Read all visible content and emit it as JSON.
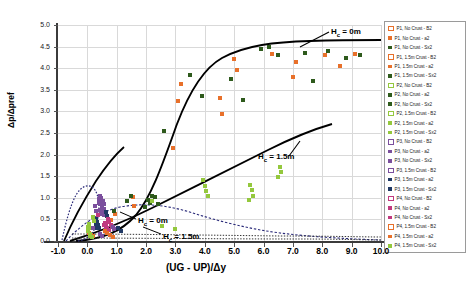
{
  "chart_data": {
    "type": "scatter",
    "title": "",
    "xlabel": "(UG - UP)/Δy",
    "ylabel": "Δp/Δpref",
    "xlim": [
      -1.0,
      10.0
    ],
    "ylim": [
      0.0,
      5.0
    ],
    "xticks": [
      "-1.0",
      "0.0",
      "1.0",
      "2.0",
      "3.0",
      "4.0",
      "5.0",
      "6.0",
      "7.0",
      "8.0",
      "9.0",
      "10.0"
    ],
    "yticks": [
      "0.0",
      "0.5",
      "1.0",
      "1.5",
      "2.0",
      "2.5",
      "3.0",
      "3.5",
      "4.0",
      "4.5",
      "5.0"
    ],
    "grid": true,
    "legend_position": "right",
    "colors": {
      "orange": "#E8702A",
      "dark_green": "#2E5A1C",
      "light_green": "#94C83D",
      "purple": "#7B4F9D",
      "dark_blue": "#1F3864",
      "magenta": "#C0397F",
      "curve": "#000000"
    },
    "annotations": [
      {
        "text": "H",
        "sub": "c",
        "rest": " = 0m",
        "x": 331,
        "y": 27,
        "name": "annotation-hc-0m-upper"
      },
      {
        "text": "H",
        "sub": "c",
        "rest": " = 1.5m",
        "x": 258,
        "y": 152,
        "name": "annotation-hc-15m-upper"
      },
      {
        "text": "H",
        "sub": "c",
        "rest": " = 0m",
        "x": 138,
        "y": 216,
        "name": "annotation-hc-0m-lower"
      },
      {
        "text": "H",
        "sub": "c",
        "rest": " = 1.5m",
        "x": 163,
        "y": 232,
        "name": "annotation-hc-15m-lower"
      }
    ],
    "series": [
      {
        "name": "P1, No Crust - B2",
        "marker": "hollow-square",
        "color": "#E8702A",
        "points": []
      },
      {
        "name": "P1, No Crust - a2",
        "marker": "square",
        "color": "#E8702A",
        "points": [
          [
            3.1,
            3.25
          ],
          [
            3.2,
            3.64
          ],
          [
            4.5,
            3.3
          ],
          [
            4.6,
            2.94
          ],
          [
            5.0,
            4.22
          ],
          [
            5.1,
            3.95
          ],
          [
            6.3,
            4.33
          ],
          [
            7.0,
            3.8
          ],
          [
            7.1,
            4.14
          ],
          [
            8.1,
            4.3
          ],
          [
            8.6,
            4.05
          ],
          [
            9.1,
            4.33
          ],
          [
            2.9,
            2.15
          ]
        ]
      },
      {
        "name": "P1, No Crust - Sx2",
        "marker": "square",
        "color": "#2E5A1C",
        "points": [
          [
            3.5,
            3.85
          ],
          [
            3.9,
            3.35
          ],
          [
            4.9,
            3.75
          ],
          [
            5.3,
            3.26
          ],
          [
            5.9,
            4.45
          ],
          [
            6.2,
            4.5
          ],
          [
            6.5,
            4.3
          ],
          [
            7.4,
            4.36
          ],
          [
            7.7,
            3.71
          ],
          [
            8.2,
            4.4
          ],
          [
            8.8,
            4.23
          ],
          [
            9.3,
            4.3
          ],
          [
            2.6,
            2.55
          ]
        ]
      },
      {
        "name": "P1, 1.5m Crust - B2",
        "marker": "hollow-square",
        "color": "#E8702A",
        "points": []
      },
      {
        "name": "P1, 1.5m Crust - a2",
        "marker": "square",
        "color": "#E8702A",
        "points": [
          [
            1.55,
            1.02
          ],
          [
            1.6,
            0.8
          ],
          [
            0.95,
            0.62
          ],
          [
            0.8,
            0.48
          ]
        ]
      },
      {
        "name": "P1, 1.5m Crust - Sx2",
        "marker": "square",
        "color": "#2E5A1C",
        "points": [
          [
            1.5,
            1.05
          ],
          [
            1.35,
            0.92
          ],
          [
            0.9,
            0.7
          ]
        ]
      },
      {
        "name": "P2, No Crust - B2",
        "marker": "hollow-square",
        "color": "#94C83D",
        "points": []
      },
      {
        "name": "P2, No Crust - a2",
        "marker": "square",
        "color": "#2E5A1C",
        "points": [
          [
            2.05,
            0.95
          ],
          [
            2.15,
            0.88
          ],
          [
            2.2,
            1.05
          ],
          [
            1.95,
            0.78
          ]
        ]
      },
      {
        "name": "P2, No Crust - Sx2",
        "marker": "square",
        "color": "#2E5A1C",
        "points": [
          [
            2.3,
            1.02
          ],
          [
            2.4,
            0.85
          ]
        ]
      },
      {
        "name": "P2, 1.5m Crust - B2",
        "marker": "hollow-square",
        "color": "#94C83D",
        "points": []
      },
      {
        "name": "P2, 1.5m Crust - a2",
        "marker": "square",
        "color": "#94C83D",
        "points": [
          [
            3.95,
            1.42
          ],
          [
            4.0,
            1.28
          ],
          [
            4.05,
            1.15
          ],
          [
            5.55,
            1.3
          ],
          [
            5.6,
            1.18
          ],
          [
            5.65,
            1.05
          ],
          [
            6.55,
            1.72
          ],
          [
            6.6,
            1.6
          ],
          [
            2.2,
            0.92
          ]
        ]
      },
      {
        "name": "P2, 1.5m Crust - Sx2",
        "marker": "square",
        "color": "#94C83D",
        "points": [
          [
            4.1,
            1.05
          ],
          [
            5.5,
            0.95
          ],
          [
            6.5,
            1.48
          ]
        ]
      },
      {
        "name": "P3, No Crust - B2",
        "marker": "hollow-square",
        "color": "#7B4F9D",
        "points": []
      },
      {
        "name": "P3, No Crust - a2",
        "marker": "square",
        "color": "#7B4F9D",
        "points": [
          [
            0.42,
            1.05
          ],
          [
            0.45,
            0.95
          ],
          [
            0.48,
            0.85
          ],
          [
            0.5,
            0.76
          ],
          [
            0.52,
            0.68
          ],
          [
            0.55,
            0.6
          ]
        ]
      },
      {
        "name": "P3, No Crust - Sx2",
        "marker": "square",
        "color": "#7B4F9D",
        "points": [
          [
            0.38,
            0.98
          ],
          [
            0.4,
            0.88
          ],
          [
            0.44,
            0.72
          ],
          [
            0.46,
            0.62
          ]
        ]
      },
      {
        "name": "P3, 1.5m Crust - B2",
        "marker": "hollow-square",
        "color": "#7B4F9D",
        "points": []
      },
      {
        "name": "P3, 1.5m Crust - a2",
        "marker": "square",
        "color": "#1F3864",
        "points": [
          [
            0.3,
            0.52
          ],
          [
            0.33,
            0.44
          ],
          [
            0.36,
            0.36
          ],
          [
            0.39,
            0.3
          ]
        ]
      },
      {
        "name": "P3, 1.5m Crust - Sx2",
        "marker": "square",
        "color": "#1F3864",
        "points": [
          [
            0.28,
            0.46
          ],
          [
            0.31,
            0.38
          ],
          [
            0.34,
            0.31
          ]
        ]
      },
      {
        "name": "P4, No Crust - B2",
        "marker": "hollow-square",
        "color": "#C0397F",
        "points": []
      },
      {
        "name": "P4, No Crust - a2",
        "marker": "square",
        "color": "#C0397F",
        "points": [
          [
            0.6,
            0.42
          ],
          [
            0.64,
            0.36
          ],
          [
            0.68,
            0.3
          ],
          [
            0.72,
            0.25
          ]
        ]
      },
      {
        "name": "P4, No Crust - Sx2",
        "marker": "square",
        "color": "#C0397F",
        "points": [
          [
            0.56,
            0.38
          ],
          [
            0.62,
            0.31
          ],
          [
            0.66,
            0.26
          ]
        ]
      },
      {
        "name": "P4, 1.5m Crust - B2",
        "marker": "hollow-square",
        "color": "#E8702A",
        "points": []
      },
      {
        "name": "P4, 1.5m Crust - a2",
        "marker": "square",
        "color": "#E8702A",
        "points": [
          [
            0.05,
            0.18
          ],
          [
            0.12,
            0.14
          ],
          [
            0.2,
            0.11
          ]
        ]
      },
      {
        "name": "P4, 1.5m Crust - Sx2",
        "marker": "square",
        "color": "#94C83D",
        "points": [
          [
            0.02,
            0.32
          ],
          [
            0.03,
            0.22
          ],
          [
            0.08,
            0.16
          ],
          [
            0.15,
            0.1
          ]
        ]
      }
    ],
    "extra_points": [
      {
        "x": 0.1,
        "y": 0.3,
        "color": "#94C83D"
      },
      {
        "x": 0.1,
        "y": 0.12,
        "color": "#94C83D"
      },
      {
        "x": 0.05,
        "y": 0.4,
        "color": "#94C83D"
      },
      {
        "x": 0.2,
        "y": 0.3,
        "color": "#7B4F9D"
      },
      {
        "x": 0.55,
        "y": 0.85,
        "color": "#7B4F9D"
      },
      {
        "x": 0.58,
        "y": 0.75,
        "color": "#7B4F9D"
      },
      {
        "x": 0.62,
        "y": 0.66,
        "color": "#1F3864"
      },
      {
        "x": 0.66,
        "y": 0.58,
        "color": "#1F3864"
      },
      {
        "x": 0.7,
        "y": 0.5,
        "color": "#C0397F"
      },
      {
        "x": 0.74,
        "y": 0.44,
        "color": "#C0397F"
      },
      {
        "x": 0.8,
        "y": 0.38,
        "color": "#C0397F"
      },
      {
        "x": 0.86,
        "y": 0.32,
        "color": "#7B4F9D"
      },
      {
        "x": 0.9,
        "y": 0.27,
        "color": "#7B4F9D"
      },
      {
        "x": 0.35,
        "y": 0.6,
        "color": "#C0397F"
      },
      {
        "x": 0.3,
        "y": 0.7,
        "color": "#7B4F9D"
      },
      {
        "x": 0.25,
        "y": 0.8,
        "color": "#7B4F9D"
      },
      {
        "x": 0.48,
        "y": 1.0,
        "color": "#7B4F9D"
      },
      {
        "x": 0.52,
        "y": 0.92,
        "color": "#7B4F9D"
      },
      {
        "x": 0.6,
        "y": 0.22,
        "color": "#E8702A"
      },
      {
        "x": 0.68,
        "y": 0.18,
        "color": "#E8702A"
      },
      {
        "x": 0.78,
        "y": 0.14,
        "color": "#E8702A"
      },
      {
        "x": 0.88,
        "y": 0.1,
        "color": "#E8702A"
      },
      {
        "x": 0.44,
        "y": 0.16,
        "color": "#7B4F9D"
      },
      {
        "x": 0.5,
        "y": 0.12,
        "color": "#7B4F9D"
      },
      {
        "x": 1.05,
        "y": 0.3,
        "color": "#1F3864"
      },
      {
        "x": 1.15,
        "y": 0.24,
        "color": "#1F3864"
      },
      {
        "x": 0.18,
        "y": 0.55,
        "color": "#94C83D"
      },
      {
        "x": 0.22,
        "y": 0.46,
        "color": "#94C83D"
      },
      {
        "x": 2.55,
        "y": 0.35,
        "color": "#94C83D"
      },
      {
        "x": 3.0,
        "y": 0.28,
        "color": "#94C83D"
      }
    ]
  },
  "legend": {
    "items": [
      {
        "label": "P1, No Crust - B2",
        "color": "#E8702A",
        "hollow": true
      },
      {
        "label": "P1, No Crust - a2",
        "color": "#E8702A",
        "hollow": false
      },
      {
        "label": "P1, No Crust - Sx2",
        "color": "#2E5A1C",
        "hollow": false
      },
      {
        "label": "P1, 1.5m Crust - B2",
        "color": "#E8702A",
        "hollow": true
      },
      {
        "label": "P1, 1.5m Crust - a2",
        "color": "#E8702A",
        "hollow": false
      },
      {
        "label": "P1, 1.5m Crust - Sx2",
        "color": "#2E5A1C",
        "hollow": false
      },
      {
        "label": "P2, No Crust - B2",
        "color": "#94C83D",
        "hollow": true
      },
      {
        "label": "P2, No Crust - a2",
        "color": "#2E5A1C",
        "hollow": false
      },
      {
        "label": "P2, No Crust - Sx2",
        "color": "#2E5A1C",
        "hollow": false
      },
      {
        "label": "P2, 1.5m Crust - B2",
        "color": "#94C83D",
        "hollow": true
      },
      {
        "label": "P2, 1.5m Crust - a2",
        "color": "#94C83D",
        "hollow": false
      },
      {
        "label": "P2, 1.5m Crust - Sx2",
        "color": "#94C83D",
        "hollow": false
      },
      {
        "label": "P3, No Crust - B2",
        "color": "#7B4F9D",
        "hollow": true
      },
      {
        "label": "P3, No Crust - a2",
        "color": "#7B4F9D",
        "hollow": false
      },
      {
        "label": "P3, No Crust - Sx2",
        "color": "#7B4F9D",
        "hollow": false
      },
      {
        "label": "P3, 1.5m Crust - B2",
        "color": "#7B4F9D",
        "hollow": true
      },
      {
        "label": "P3, 1.5m Crust - a2",
        "color": "#1F3864",
        "hollow": false
      },
      {
        "label": "P3, 1.5m Crust - Sx2",
        "color": "#1F3864",
        "hollow": false
      },
      {
        "label": "P4, No Crust - B2",
        "color": "#C0397F",
        "hollow": true
      },
      {
        "label": "P4, No Crust - a2",
        "color": "#C0397F",
        "hollow": false
      },
      {
        "label": "P4, No Crust - Sx2",
        "color": "#C0397F",
        "hollow": false
      },
      {
        "label": "P4, 1.5m Crust - B2",
        "color": "#E8702A",
        "hollow": true
      },
      {
        "label": "P4, 1.5m Crust - a2",
        "color": "#E8702A",
        "hollow": false
      },
      {
        "label": "P4, 1.5m Crust - Sx2",
        "color": "#94C83D",
        "hollow": false
      }
    ]
  }
}
